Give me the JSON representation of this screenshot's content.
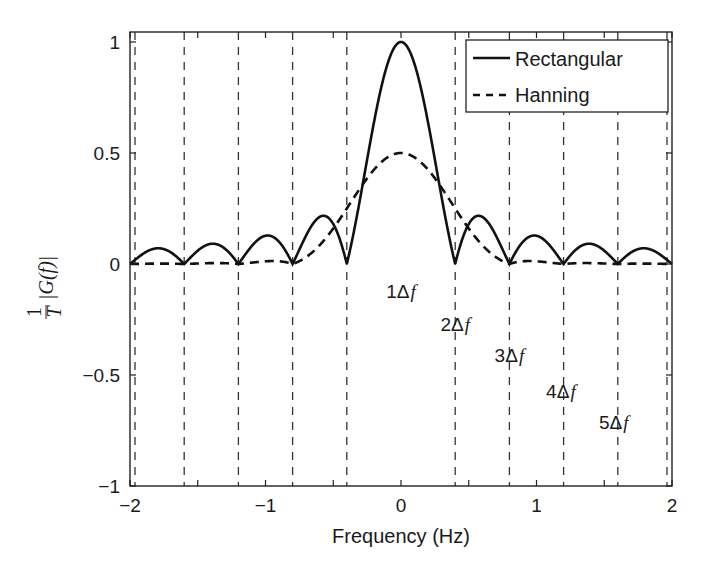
{
  "chart_data": {
    "type": "line",
    "title": "",
    "xlabel": "Frequency (Hz)",
    "ylabel": "1/T |G(f)|",
    "ylabel_parts": {
      "num": "1",
      "den": "T",
      "body": "|G(f)|"
    },
    "xlim": [
      -2,
      2
    ],
    "ylim": [
      -1,
      1.045
    ],
    "grid": false,
    "legend_position": "upper right",
    "xticks": [
      -2,
      -1,
      0,
      1,
      2
    ],
    "xtick_labels": [
      "−2",
      "−1",
      "0",
      "1",
      "2"
    ],
    "xminor_ticks": [
      -1.5,
      -0.5,
      0.5,
      1.5
    ],
    "yticks": [
      -1,
      -0.5,
      0,
      0.5,
      1
    ],
    "ytick_labels": [
      "−1",
      "−0.5",
      "0",
      "0.5",
      "1"
    ],
    "delta_f": 0.4,
    "vertical_dashed_lines_x": [
      -2.0,
      -1.6,
      -1.2,
      -0.8,
      -0.4,
      0.4,
      0.8,
      1.2,
      1.6,
      2.0
    ],
    "annotations": [
      {
        "text": "1Δf",
        "num": "1",
        "sym": "Δ",
        "var": "f",
        "x": 0.0,
        "y": -0.12
      },
      {
        "text": "2Δf",
        "num": "2",
        "sym": "Δ",
        "var": "f",
        "x": 0.4,
        "y": -0.27
      },
      {
        "text": "3Δf",
        "num": "3",
        "sym": "Δ",
        "var": "f",
        "x": 0.8,
        "y": -0.41
      },
      {
        "text": "4Δf",
        "num": "4",
        "sym": "Δ",
        "var": "f",
        "x": 1.18,
        "y": -0.57
      },
      {
        "text": "5Δf",
        "num": "5",
        "sym": "Δ",
        "var": "f",
        "x": 1.57,
        "y": -0.71
      }
    ],
    "series": [
      {
        "name": "Rectangular",
        "style": "solid",
        "formula": "|sinc(f/delta_f)|",
        "x": [
          -2.0,
          -1.8,
          -1.6,
          -1.4,
          -1.2,
          -1.0,
          -0.8,
          -0.6,
          -0.4,
          -0.2,
          0.0,
          0.2,
          0.4,
          0.6,
          0.8,
          1.0,
          1.2,
          1.4,
          1.6,
          1.8,
          2.0
        ],
        "values": [
          0.0,
          0.071,
          0.0,
          0.091,
          0.0,
          0.127,
          0.0,
          0.212,
          0.0,
          0.637,
          1.0,
          0.637,
          0.0,
          0.212,
          0.0,
          0.127,
          0.0,
          0.091,
          0.0,
          0.071,
          0.0
        ]
      },
      {
        "name": "Hanning",
        "style": "dashed",
        "formula": "0.5*|sinc(u) + 0.5*sinc(u-1) + 0.5*sinc(u+1)|, u = f/delta_f",
        "x": [
          -2.0,
          -1.6,
          -1.2,
          -0.8,
          -0.6,
          -0.4,
          -0.2,
          0.0,
          0.2,
          0.4,
          0.6,
          0.8,
          1.2,
          1.6,
          2.0
        ],
        "values": [
          0.0,
          0.0,
          0.0,
          0.0,
          0.042,
          0.25,
          0.424,
          0.5,
          0.424,
          0.25,
          0.042,
          0.0,
          0.0,
          0.0,
          0.0
        ]
      }
    ]
  },
  "legend": {
    "items": [
      {
        "label": "Rectangular",
        "style": "solid"
      },
      {
        "label": "Hanning",
        "style": "dashed"
      }
    ]
  },
  "colors": {
    "line": "#111111",
    "axes": "#222222",
    "background": "#ffffff"
  }
}
